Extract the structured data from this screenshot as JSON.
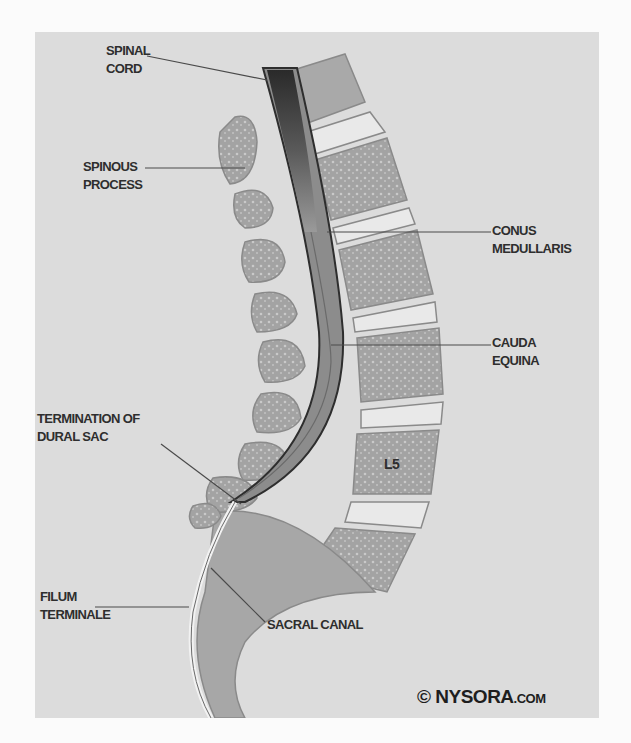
{
  "diagram": {
    "labels": {
      "spinal_cord": [
        "SPINAL",
        "CORD"
      ],
      "spinous_process": [
        "SPINOUS",
        "PROCESS"
      ],
      "conus_medullaris": [
        "CONUS",
        "MEDULLARIS"
      ],
      "cauda_equina": [
        "CAUDA",
        "EQUINA"
      ],
      "termination_dural_sac": [
        "TERMINATION OF",
        "DURAL SAC"
      ],
      "filum_terminale": [
        "FILUM",
        "TERMINALE"
      ],
      "sacral_canal": "SACRAL CANAL",
      "vertebra_l5": "L5"
    },
    "copyright": {
      "symbol": "©",
      "brand": "NYSORA",
      "suffix": ".COM"
    },
    "colors": {
      "background": "#dcdcdc",
      "bone": "#a9a9a9",
      "disc": "#e9e9e9",
      "cord_dark": "#3a3a3a",
      "dura": "#8c8c8c",
      "text": "#2e2e2e"
    }
  }
}
